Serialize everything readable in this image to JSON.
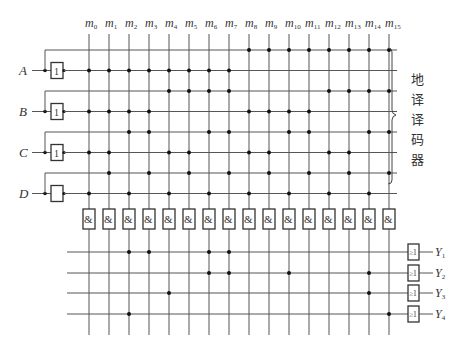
{
  "decoder_label": "地译译码器",
  "columns": [
    "m0",
    "m1",
    "m2",
    "m3",
    "m4",
    "m5",
    "m6",
    "m7",
    "m8",
    "m9",
    "m10",
    "m11",
    "m12",
    "m13",
    "m14",
    "m15"
  ],
  "column_labels": [
    {
      "base": "m",
      "sub": "0"
    },
    {
      "base": "m",
      "sub": "1"
    },
    {
      "base": "m",
      "sub": "2"
    },
    {
      "base": "m",
      "sub": "3"
    },
    {
      "base": "m",
      "sub": "4"
    },
    {
      "base": "m",
      "sub": "5"
    },
    {
      "base": "m",
      "sub": "6"
    },
    {
      "base": "m",
      "sub": "7"
    },
    {
      "base": "m",
      "sub": "8"
    },
    {
      "base": "m",
      "sub": "9"
    },
    {
      "base": "m",
      "sub": "10"
    },
    {
      "base": "m",
      "sub": "11"
    },
    {
      "base": "m",
      "sub": "12"
    },
    {
      "base": "m",
      "sub": "13"
    },
    {
      "base": "m",
      "sub": "14"
    },
    {
      "base": "m",
      "sub": "15"
    }
  ],
  "inputs": [
    {
      "name": "A",
      "buffer_label": "1",
      "rows": {
        "complement": [
          8,
          9,
          10,
          11,
          12,
          13,
          14,
          15
        ],
        "true": [
          0,
          1,
          2,
          3,
          4,
          5,
          6,
          7
        ]
      }
    },
    {
      "name": "B",
      "buffer_label": "1",
      "rows": {
        "complement": [
          4,
          5,
          6,
          7,
          12,
          13,
          14,
          15
        ],
        "true": [
          0,
          1,
          2,
          3,
          8,
          9,
          10,
          11
        ]
      }
    },
    {
      "name": "C",
      "buffer_label": "1",
      "rows": {
        "complement": [
          2,
          3,
          6,
          7,
          10,
          11,
          14,
          15
        ],
        "true": [
          0,
          1,
          4,
          5,
          8,
          9,
          12,
          13
        ]
      }
    },
    {
      "name": "D",
      "buffer_label": "",
      "rows": {
        "complement": [
          1,
          3,
          5,
          7,
          9,
          11,
          13,
          15
        ],
        "true": [
          0,
          2,
          4,
          6,
          8,
          10,
          12,
          14
        ]
      }
    }
  ],
  "and_gate_label": "&",
  "or_gate_label": "≥1",
  "outputs": [
    {
      "name": "Y",
      "sub": "1",
      "minterms": [
        2,
        3,
        6,
        7
      ]
    },
    {
      "name": "Y",
      "sub": "2",
      "minterms": [
        6,
        7,
        10,
        14
      ]
    },
    {
      "name": "Y",
      "sub": "3",
      "minterms": [
        4,
        14
      ]
    },
    {
      "name": "Y",
      "sub": "4",
      "minterms": [
        2,
        15
      ]
    }
  ]
}
